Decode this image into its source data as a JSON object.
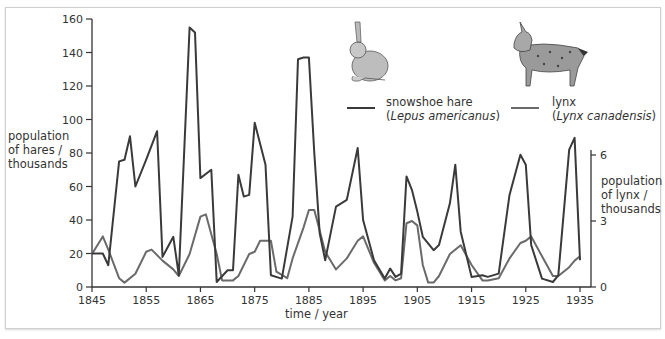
{
  "chart_data": {
    "type": "line",
    "title": "",
    "xlabel": "time / year",
    "ylabel_left": "population of hares / thousands",
    "ylabel_right": "population of lynx / thousands",
    "x_ticks": [
      1845,
      1855,
      1865,
      1875,
      1885,
      1895,
      1905,
      1915,
      1925,
      1935
    ],
    "y_left_ticks": [
      0,
      20,
      40,
      60,
      80,
      100,
      120,
      140,
      160
    ],
    "y_right_ticks": [
      0,
      3,
      6
    ],
    "xlim": [
      1845,
      1935
    ],
    "ylim_left": [
      0,
      160
    ],
    "ylim_right": [
      0,
      7.3
    ],
    "grid": false,
    "legend_position": "top-right",
    "series": [
      {
        "name": "snowshoe hare",
        "scientific_name": "Lepus americanus",
        "axis": "left",
        "color": "#3a3a3a",
        "x": [
          1845,
          1847,
          1848,
          1850,
          1851,
          1852,
          1853,
          1855,
          1857,
          1858,
          1860,
          1861,
          1863,
          1864,
          1865,
          1867,
          1868,
          1870,
          1871,
          1872,
          1873,
          1874,
          1875,
          1877,
          1878,
          1880,
          1882,
          1883,
          1884,
          1885,
          1886,
          1887,
          1888,
          1890,
          1892,
          1894,
          1895,
          1897,
          1899,
          1900,
          1901,
          1902,
          1903,
          1904,
          1905,
          1906,
          1908,
          1909,
          1911,
          1912,
          1913,
          1915,
          1917,
          1918,
          1920,
          1922,
          1924,
          1925,
          1926,
          1928,
          1930,
          1931,
          1933,
          1934,
          1935
        ],
        "values": [
          20,
          20,
          13,
          75,
          76,
          90,
          60,
          76,
          93,
          18,
          30,
          7,
          155,
          152,
          65,
          70,
          3,
          10,
          10,
          67,
          54,
          55,
          98,
          73,
          7,
          5,
          42,
          136,
          137,
          137,
          80,
          32,
          16,
          48,
          52,
          83,
          40,
          16,
          5,
          11,
          6,
          8,
          66,
          58,
          45,
          30,
          22,
          25,
          50,
          73,
          33,
          6,
          7,
          6,
          8,
          55,
          79,
          73,
          25,
          5,
          3,
          7,
          82,
          89,
          16
        ]
      },
      {
        "name": "lynx",
        "scientific_name": "Lynx canadensis",
        "axis": "right",
        "color": "#6a6a6a",
        "x": [
          1845,
          1847,
          1848,
          1850,
          1851,
          1853,
          1855,
          1856,
          1858,
          1860,
          1861,
          1863,
          1865,
          1866,
          1868,
          1869,
          1871,
          1872,
          1874,
          1875,
          1876,
          1878,
          1879,
          1881,
          1882,
          1884,
          1885,
          1886,
          1888,
          1890,
          1892,
          1894,
          1895,
          1897,
          1899,
          1900,
          1901,
          1902,
          1903,
          1904,
          1905,
          1906,
          1907,
          1908,
          1909,
          1911,
          1913,
          1915,
          1917,
          1918,
          1920,
          1922,
          1924,
          1925,
          1926,
          1928,
          1930,
          1931,
          1933,
          1934,
          1935
        ],
        "values": [
          1.5,
          2.3,
          1.7,
          0.4,
          0.2,
          0.6,
          1.6,
          1.7,
          1.2,
          0.8,
          0.5,
          1.5,
          3.2,
          3.3,
          1.5,
          0.3,
          0.3,
          0.5,
          1.5,
          1.6,
          2.1,
          2.1,
          0.7,
          0.4,
          1.3,
          2.7,
          3.5,
          3.5,
          1.6,
          0.8,
          1.3,
          2.1,
          2.3,
          1.1,
          0.3,
          0.5,
          0.3,
          0.4,
          2.9,
          3.0,
          2.8,
          1.0,
          0.2,
          0.2,
          0.5,
          1.5,
          1.9,
          1.0,
          0.3,
          0.3,
          0.4,
          1.3,
          2.0,
          2.1,
          2.3,
          1.4,
          0.5,
          0.5,
          0.9,
          1.2,
          1.4
        ]
      }
    ]
  },
  "axes": {
    "left_ticks": [
      "0",
      "20",
      "40",
      "60",
      "80",
      "100",
      "120",
      "140",
      "160"
    ],
    "right_ticks": [
      "0",
      "3",
      "6"
    ],
    "x_ticks": [
      "1845",
      "1855",
      "1865",
      "1875",
      "1885",
      "1895",
      "1905",
      "1915",
      "1925",
      "1935"
    ],
    "left_label": [
      "population",
      "of hares /",
      "thousands"
    ],
    "right_label": [
      "population",
      "of lynx /",
      "thousands"
    ],
    "x_label": "time / year"
  },
  "legend": {
    "hare": {
      "common": "snowshoe hare",
      "scientific": "Lepus americanus",
      "icon": "hare-illustration"
    },
    "lynx": {
      "common": "lynx",
      "scientific": "Lynx canadensis",
      "icon": "lynx-illustration"
    }
  }
}
